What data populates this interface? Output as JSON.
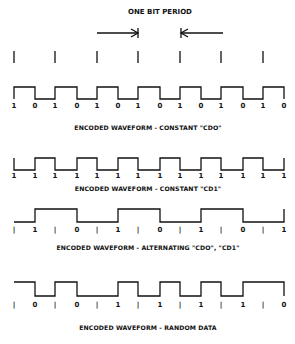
{
  "title": "ONE BIT PERIOD",
  "cell_boundaries_x": [
    14,
    55,
    97,
    138,
    180,
    221,
    263,
    284
  ],
  "bit_period_marker": {
    "left_bar_x": 138,
    "right_bar_x": 181,
    "arrow_left_start_x": 97,
    "arrow_right_start_x": 223
  },
  "waveforms": [
    {
      "name": "constant-cd0",
      "caption": "ENCODED WAVEFORM - CONSTANT \"CDO\"",
      "labels": [
        "1",
        "0",
        "1",
        "0",
        "1",
        "0",
        "1",
        "0",
        "1",
        "0",
        "1",
        "0",
        "1",
        "0"
      ],
      "high_y": 87,
      "low_y": 99,
      "label_y": 108,
      "caption_y": 130,
      "points": "14,99 14,87 35,87 35,99 55,99 55,87 77,87 77,99 97,99 97,87 118,87 118,99 138,99 138,87 160,87 160,99 180,99 180,87 201,87 201,99 221,99 221,87 243,87 243,99 263,99 263,87 284,87 284,99"
    },
    {
      "name": "constant-cd1",
      "caption": "ENCODED WAVEFORM - CONSTANT \"CD1\"",
      "labels": [
        "1",
        "1",
        "1",
        "1",
        "1",
        "1",
        "1",
        "1",
        "1",
        "1",
        "1",
        "1",
        "1",
        "1"
      ],
      "high_y": 158,
      "low_y": 170,
      "label_y": 178,
      "caption_y": 191,
      "points": "14,158 14,170 35,170 35,158 55,158 55,170 77,170 77,158 97,158 97,170 118,170 118,158 138,158 138,170 160,170 160,158 180,158 180,170 201,170 201,158 221,158 221,170 243,170 243,158 263,158 263,170 284,170 284,158"
    },
    {
      "name": "alternating",
      "caption": "ENCODED WAVEFORM - ALTERNATING \"CDO\", \"CD1\"",
      "labels": [
        "|",
        "1",
        "|",
        "0",
        "|",
        "1",
        "|",
        "0",
        "|",
        "1",
        "|",
        "0",
        "|",
        "1"
      ],
      "high_y": 209,
      "low_y": 222,
      "label_y": 232,
      "caption_y": 250,
      "points": "14,222 35,222 35,209 77,209 77,222 118,222 118,209 160,209 160,222 201,222 201,209 243,209 243,222 284,222 284,209"
    },
    {
      "name": "random-data",
      "caption": "ENCODED WAVEFORM - RANDOM DATA",
      "labels": [
        "|",
        "0",
        "|",
        "0",
        "|",
        "1",
        "|",
        "1",
        "|",
        "1",
        "|",
        "1",
        "|",
        "0"
      ],
      "high_y": 282,
      "low_y": 296,
      "label_y": 307,
      "caption_y": 330,
      "points": "14,282 35,282 35,296 55,296 55,282 77,282 77,296 118,296 118,282 138,282 138,296 160,296 160,282 180,282 180,296 201,296 201,282 221,282 221,296 243,296 243,282 284,282 284,296"
    }
  ],
  "label_x": [
    14,
    35,
    55,
    77,
    97,
    118,
    138,
    160,
    180,
    201,
    221,
    243,
    263,
    284
  ]
}
